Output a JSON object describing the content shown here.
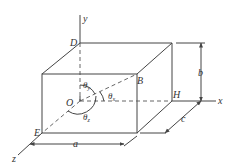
{
  "diagram": {
    "type": "3d-rectangular-box-with-axes",
    "axes": {
      "x": "x",
      "y": "y",
      "z": "z"
    },
    "points": {
      "O": "O",
      "D": "D",
      "B": "B",
      "H": "H",
      "E": "E"
    },
    "dimensions": {
      "a": "a",
      "b": "b",
      "c": "c"
    },
    "angles": {
      "theta_x": {
        "symbol": "θ",
        "sub": "x"
      },
      "theta_y": {
        "symbol": "θ",
        "sub": "y"
      },
      "theta_z": {
        "symbol": "θ",
        "sub": "z"
      }
    },
    "colors": {
      "line": "#444444",
      "background": "#ffffff",
      "text": "#333333"
    }
  }
}
